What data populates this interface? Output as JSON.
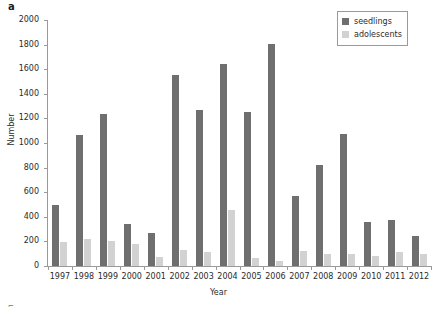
{
  "panel": {
    "letter": "a"
  },
  "legend": {
    "position": "top-right",
    "entries": [
      {
        "label": "seedlings",
        "color": "#6f6f6f"
      },
      {
        "label": "adolescents",
        "color": "#d2d2d2"
      }
    ]
  },
  "axes": {
    "y_title": "Number",
    "x_title": "Year",
    "y_ticks": [
      "0",
      "200",
      "400",
      "600",
      "800",
      "1000",
      "1200",
      "1400",
      "1600",
      "1800",
      "2000"
    ]
  },
  "chart_data": {
    "type": "bar",
    "title": "",
    "subtitle": "",
    "xlabel": "Year",
    "ylabel": "Number",
    "ylim": [
      0,
      2000
    ],
    "ytick_step": 200,
    "grid": false,
    "legend_position": "top-right",
    "categories": [
      "1997",
      "1998",
      "1999",
      "2000",
      "2001",
      "2002",
      "2003",
      "2004",
      "2005",
      "2006",
      "2007",
      "2008",
      "2009",
      "2010",
      "2011",
      "2012"
    ],
    "series": [
      {
        "name": "seedlings",
        "color": "#6f6f6f",
        "values": [
          500,
          1065,
          1235,
          340,
          265,
          1555,
          1265,
          1645,
          1255,
          1805,
          570,
          820,
          1075,
          360,
          375,
          240
        ]
      },
      {
        "name": "adolescents",
        "color": "#d2d2d2",
        "values": [
          195,
          220,
          200,
          175,
          75,
          130,
          110,
          455,
          65,
          40,
          125,
          95,
          100,
          80,
          115,
          95
        ]
      }
    ]
  }
}
